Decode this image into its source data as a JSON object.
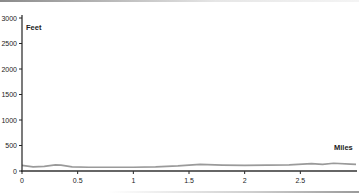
{
  "chart_data": {
    "type": "line",
    "title": "",
    "xlabel": "Miles",
    "ylabel": "Feet",
    "xlim": [
      0,
      3.0
    ],
    "ylim": [
      0,
      3000
    ],
    "x_ticks": [
      "0",
      "0.5",
      "1",
      "1.5",
      "2",
      "2.5"
    ],
    "y_ticks": [
      "0",
      "500",
      "1000",
      "1500",
      "2000",
      "2500",
      "3000"
    ],
    "grid": false,
    "legend": null,
    "series": [
      {
        "name": "Elevation",
        "color": "#9a9a9a",
        "x": [
          0,
          0.1,
          0.2,
          0.3,
          0.35,
          0.45,
          0.6,
          0.8,
          1.0,
          1.2,
          1.4,
          1.6,
          1.8,
          2.0,
          2.2,
          2.4,
          2.6,
          2.7,
          2.8,
          2.95,
          3.0
        ],
        "values": [
          110,
          80,
          90,
          120,
          115,
          80,
          75,
          75,
          75,
          80,
          100,
          130,
          115,
          110,
          115,
          120,
          145,
          130,
          150,
          135,
          130
        ]
      }
    ]
  },
  "labels": {
    "y_axis_title": "Feet",
    "x_axis_title": "Miles"
  }
}
